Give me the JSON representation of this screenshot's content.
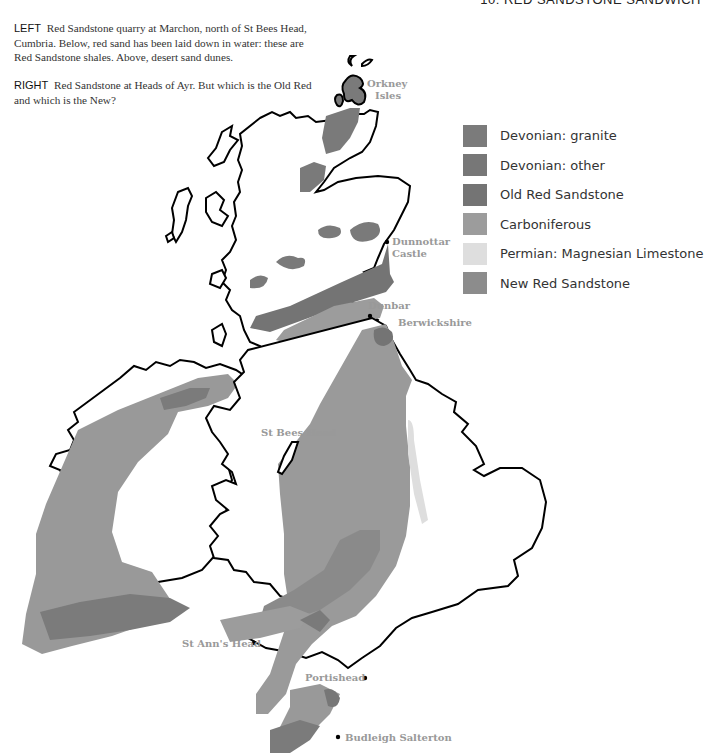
{
  "running_header": "10: RED SANDSTONE SANDWICH",
  "captions": {
    "left": {
      "lead": "LEFT",
      "text": "Red Sandstone quarry at Marchon, north of St Bees Head, Cumbria. Below, red sand has been laid down in water: these are Red Sandstone shales. Above, desert sand dunes."
    },
    "right": {
      "lead": "RIGHT",
      "text": "Red Sandstone at Heads of Ayr. But which is the Old Red and which is the New?"
    }
  },
  "legend": [
    {
      "label": "Devonian: granite",
      "color": "#7b7b7b"
    },
    {
      "label": "Devonian: other",
      "color": "#777777"
    },
    {
      "label": "Old Red Sandstone",
      "color": "#747474"
    },
    {
      "label": "Carboniferous",
      "color": "#9c9c9c"
    },
    {
      "label": "Permian: Magnesian Limestone",
      "color": "#dedede"
    },
    {
      "label": "New Red Sandstone",
      "color": "#8c8c8c"
    }
  ],
  "places": {
    "orkney": "Orkney",
    "orkney2": "Isles",
    "dunnottar": "Dunnottar",
    "dunnottar2": "Castle",
    "dunbar": "Dunbar",
    "berwickshire": "Berwickshire",
    "st_bees": "St Bees Head",
    "st_anns": "St Ann's Head",
    "portishead": "Portishead",
    "budleigh": "Budleigh Salterton"
  }
}
